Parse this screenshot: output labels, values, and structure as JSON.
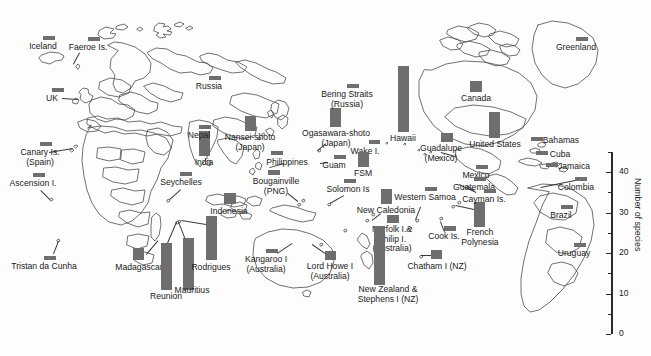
{
  "figure": {
    "type": "map-bar-chart",
    "title": "",
    "axis": {
      "label": "Number of species",
      "ticks_major": [
        0,
        10,
        20,
        30,
        40
      ],
      "ticks_minor": [
        5,
        15,
        25,
        35,
        45
      ],
      "range": [
        0,
        45
      ],
      "position": "right"
    },
    "bar_color": "#6e6e6e",
    "map_outline_color": "#4d4d4d"
  },
  "chart_data": {
    "type": "bar",
    "title": "",
    "xlabel": "",
    "ylabel": "Number of species",
    "ylim": [
      0,
      45
    ],
    "grid": false,
    "legend": "none",
    "categories": [
      "Iceland",
      "Faeroe Is.",
      "UK",
      "Canary Is. (Spain)",
      "Ascension I.",
      "Tristan da Cunha",
      "Madagascar",
      "Reunion",
      "Mauritius",
      "Rodrigues",
      "Seychelles",
      "Indonesia",
      "India",
      "Nepal",
      "Russia",
      "Nansei-shoto (Japan)",
      "Ogasawara-shoto (Japan)",
      "Bering Straits (Russia)",
      "Philippines",
      "Guam",
      "Bougainville (PNG)",
      "Solomon Is",
      "Wake I.",
      "FSM",
      "Hawaii",
      "Kangaroo I (Australia)",
      "Lord Howe I (Australia)",
      "New Caledonia",
      "Western Samoa",
      "Norfolk I. & Philip I. (Australia)",
      "New Zealand & Stephens I (NZ)",
      "Cook Is.",
      "Chatham I (NZ)",
      "French Polynesia",
      "Guadalupe (Mexico)",
      "Canada",
      "United States",
      "Greenland",
      "Mexico",
      "Guatemala",
      "Cayman Is.",
      "Bahamas",
      "Cuba",
      "Jamaica",
      "Colombia",
      "Brazil",
      "Uruguay"
    ],
    "values": [
      2,
      2,
      2,
      2,
      2,
      2,
      7,
      22,
      24,
      20,
      2,
      6,
      13,
      2,
      2,
      8,
      11,
      2,
      2,
      2,
      3,
      2,
      2,
      7,
      43,
      2,
      5,
      8,
      2,
      4,
      27,
      3,
      5,
      13,
      4,
      6,
      14,
      2,
      2,
      2,
      2,
      2,
      2,
      2,
      2,
      2,
      2
    ],
    "units": "species"
  },
  "locations": [
    {
      "name": "Iceland",
      "label": "Iceland",
      "bar_x": 43,
      "bar_y": 36,
      "bar_w": 12,
      "bar_h": 4,
      "label_x": 43,
      "label_y": 42,
      "align": "c",
      "leader": null
    },
    {
      "name": "Faeroe Is.",
      "label": "Faeroe Is.",
      "bar_x": 88,
      "bar_y": 37,
      "bar_w": 12,
      "bar_h": 4,
      "label_x": 88,
      "label_y": 43,
      "align": "c",
      "leader": {
        "x1": 80,
        "y1": 53,
        "x2": 74,
        "y2": 64
      }
    },
    {
      "name": "UK",
      "label": "UK",
      "bar_x": 52,
      "bar_y": 88,
      "bar_w": 12,
      "bar_h": 4,
      "label_x": 52,
      "label_y": 94,
      "align": "c",
      "leader": {
        "x1": 62,
        "y1": 98,
        "x2": 78,
        "y2": 99
      }
    },
    {
      "name": "Canary Is. (Spain)",
      "label": "Canary Is.\n(Spain)",
      "bar_x": 40,
      "bar_y": 142,
      "bar_w": 12,
      "bar_h": 4,
      "label_x": 40,
      "label_y": 148,
      "align": "c",
      "leader": {
        "x1": 49,
        "y1": 152,
        "x2": 73,
        "y2": 148
      }
    },
    {
      "name": "Ascension I.",
      "label": "Ascension I.",
      "bar_x": 33,
      "bar_y": 173,
      "bar_w": 12,
      "bar_h": 4,
      "label_x": 33,
      "label_y": 179,
      "align": "c",
      "leader": {
        "x1": 41,
        "y1": 190,
        "x2": 50,
        "y2": 199
      }
    },
    {
      "name": "Tristan da Cunha",
      "label": "Tristan da Cunha",
      "bar_x": 44,
      "bar_y": 256,
      "bar_w": 12,
      "bar_h": 4,
      "label_x": 44,
      "label_y": 262,
      "align": "c",
      "leader": {
        "x1": 53,
        "y1": 254,
        "x2": 58,
        "y2": 241
      }
    },
    {
      "name": "Madagascar",
      "label": "Madagascar",
      "bar_x": 133,
      "bar_y": 248,
      "bar_w": 11,
      "bar_h": 12,
      "label_x": 139,
      "label_y": 263,
      "align": "c",
      "leader": {
        "x1": 146,
        "y1": 254,
        "x2": 158,
        "y2": 240
      }
    },
    {
      "name": "Reunion",
      "label": "Reunion",
      "bar_x": 161,
      "bar_y": 243,
      "bar_w": 11,
      "bar_h": 47,
      "label_x": 166,
      "label_y": 292,
      "align": "c",
      "leader": {
        "x1": 167,
        "y1": 243,
        "x2": 176,
        "y2": 222
      }
    },
    {
      "name": "Mauritius",
      "label": "Mauritius",
      "bar_x": 183,
      "bar_y": 238,
      "bar_w": 11,
      "bar_h": 52,
      "label_x": 192,
      "label_y": 286,
      "align": "c",
      "leader": {
        "x1": 185,
        "y1": 240,
        "x2": 178,
        "y2": 222
      }
    },
    {
      "name": "Rodrigues",
      "label": "Rodrigues",
      "bar_x": 206,
      "bar_y": 216,
      "bar_w": 11,
      "bar_h": 44,
      "label_x": 211,
      "label_y": 263,
      "align": "c",
      "leader": {
        "x1": 206,
        "y1": 225,
        "x2": 181,
        "y2": 221
      }
    },
    {
      "name": "Seychelles",
      "label": "Seychelles",
      "bar_x": 180,
      "bar_y": 172,
      "bar_w": 12,
      "bar_h": 4,
      "label_x": 181,
      "label_y": 178,
      "align": "c",
      "leader": {
        "x1": 181,
        "y1": 190,
        "x2": 170,
        "y2": 200
      }
    },
    {
      "name": "Indonesia",
      "label": "Indonesia",
      "bar_x": 224,
      "bar_y": 193,
      "bar_w": 12,
      "bar_h": 11,
      "label_x": 229,
      "label_y": 207,
      "align": "c",
      "leader": null
    },
    {
      "name": "India",
      "label": "India",
      "bar_x": 199,
      "bar_y": 131,
      "bar_w": 11,
      "bar_h": 25,
      "label_x": 204,
      "label_y": 158,
      "align": "c",
      "leader": null
    },
    {
      "name": "Nepal",
      "label": "Nepal",
      "bar_x": 199,
      "bar_y": 125,
      "bar_w": 12,
      "bar_h": 4,
      "label_x": 199,
      "label_y": 131,
      "align": "c",
      "leader": null
    },
    {
      "name": "Russia",
      "label": "Russia",
      "bar_x": 209,
      "bar_y": 76,
      "bar_w": 12,
      "bar_h": 4,
      "label_x": 209,
      "label_y": 82,
      "align": "c",
      "leader": null
    },
    {
      "name": "Nansei-shoto (Japan)",
      "label": "Nansei-shoto\n(Japan)",
      "bar_x": 245,
      "bar_y": 116,
      "bar_w": 11,
      "bar_h": 15,
      "label_x": 250,
      "label_y": 133,
      "align": "c",
      "leader": null
    },
    {
      "name": "Ogasawara-shoto (Japan)",
      "label": "Ogasawara-shoto\n(Japan)",
      "bar_x": 330,
      "bar_y": 108,
      "bar_w": 11,
      "bar_h": 19,
      "label_x": 336,
      "label_y": 129,
      "align": "c",
      "leader": {
        "x1": 326,
        "y1": 144,
        "x2": 318,
        "y2": 151
      }
    },
    {
      "name": "Bering Straits (Russia)",
      "label": "Bering Straits\n(Russia)",
      "bar_x": 347,
      "bar_y": 84,
      "bar_w": 12,
      "bar_h": 4,
      "label_x": 347,
      "label_y": 90,
      "align": "c",
      "leader": null
    },
    {
      "name": "Philippines",
      "label": "Philippines",
      "bar_x": 271,
      "bar_y": 151,
      "bar_w": 12,
      "bar_h": 4,
      "label_x": 287,
      "label_y": 158,
      "align": "c",
      "leader": {
        "x1": 284,
        "y1": 164,
        "x2": 270,
        "y2": 168
      }
    },
    {
      "name": "Guam",
      "label": "Guam",
      "bar_x": 334,
      "bar_y": 155,
      "bar_w": 12,
      "bar_h": 4,
      "label_x": 334,
      "label_y": 161,
      "align": "c",
      "leader": {
        "x1": 328,
        "y1": 163,
        "x2": 320,
        "y2": 164
      }
    },
    {
      "name": "Bougainville (PNG)",
      "label": "Bougainville\n(PNG)",
      "bar_x": 268,
      "bar_y": 170,
      "bar_w": 12,
      "bar_h": 5,
      "label_x": 276,
      "label_y": 177,
      "align": "c",
      "leader": {
        "x1": 288,
        "y1": 193,
        "x2": 298,
        "y2": 201
      }
    },
    {
      "name": "Solomon Is",
      "label": "Solomon Is",
      "bar_x": 344,
      "bar_y": 179,
      "bar_w": 12,
      "bar_h": 4,
      "label_x": 348,
      "label_y": 185,
      "align": "c",
      "leader": {
        "x1": 344,
        "y1": 196,
        "x2": 330,
        "y2": 204
      }
    },
    {
      "name": "Wake I.",
      "label": "Wake I.",
      "bar_x": 369,
      "bar_y": 140,
      "bar_w": 11,
      "bar_h": 4,
      "label_x": 365,
      "label_y": 147,
      "align": "c",
      "leader": null
    },
    {
      "name": "FSM",
      "label": "FSM",
      "bar_x": 358,
      "bar_y": 152,
      "bar_w": 11,
      "bar_h": 15,
      "label_x": 363,
      "label_y": 169,
      "align": "c",
      "leader": null
    },
    {
      "name": "Hawaii",
      "label": "Hawaii",
      "bar_x": 398,
      "bar_y": 66,
      "bar_w": 11,
      "bar_h": 66,
      "label_x": 403,
      "label_y": 134,
      "align": "c",
      "leader": null
    },
    {
      "name": "Kangaroo I (Australia)",
      "label": "Kangaroo I\n(Australia)",
      "bar_x": 266,
      "bar_y": 249,
      "bar_w": 12,
      "bar_h": 4,
      "label_x": 266,
      "label_y": 255,
      "align": "c",
      "leader": {
        "x1": 277,
        "y1": 253,
        "x2": 292,
        "y2": 243
      }
    },
    {
      "name": "Lord Howe I (Australia)",
      "label": "Lord Howe I\n(Australia)",
      "bar_x": 325,
      "bar_y": 251,
      "bar_w": 11,
      "bar_h": 9,
      "label_x": 330,
      "label_y": 262,
      "align": "c",
      "leader": {
        "x1": 325,
        "y1": 254,
        "x2": 312,
        "y2": 245
      }
    },
    {
      "name": "New Caledonia",
      "label": "New Caledonia",
      "bar_x": 381,
      "bar_y": 189,
      "bar_w": 11,
      "bar_h": 15,
      "label_x": 386,
      "label_y": 206,
      "align": "c",
      "leader": {
        "x1": 381,
        "y1": 214,
        "x2": 372,
        "y2": 221
      }
    },
    {
      "name": "Western Samoa",
      "label": "Western Samoa",
      "bar_x": 425,
      "bar_y": 187,
      "bar_w": 12,
      "bar_h": 4,
      "label_x": 425,
      "label_y": 193,
      "align": "c",
      "leader": {
        "x1": 421,
        "y1": 207,
        "x2": 416,
        "y2": 220
      }
    },
    {
      "name": "Norfolk I. & Philip I. (Australia)",
      "label": "Norfolk I.&\nPhilip I.\n(Australia)",
      "bar_x": 387,
      "bar_y": 215,
      "bar_w": 12,
      "bar_h": 8,
      "label_x": 392,
      "label_y": 225,
      "align": "c",
      "leader": null
    },
    {
      "name": "New Zealand & Stephens I (NZ)",
      "label": "New Zealand &\nStephens I (NZ)",
      "bar_x": 374,
      "bar_y": 226,
      "bar_w": 11,
      "bar_h": 59,
      "label_x": 388,
      "label_y": 285,
      "align": "c",
      "leader": null
    },
    {
      "name": "Cook Is.",
      "label": "Cook Is.",
      "bar_x": 444,
      "bar_y": 226,
      "bar_w": 12,
      "bar_h": 5,
      "label_x": 444,
      "label_y": 232,
      "align": "c",
      "leader": {
        "x1": 444,
        "y1": 232,
        "x2": 440,
        "y2": 222
      }
    },
    {
      "name": "Chatham I (NZ)",
      "label": "Chatham I (NZ)",
      "bar_x": 431,
      "bar_y": 250,
      "bar_w": 11,
      "bar_h": 9,
      "label_x": 437,
      "label_y": 262,
      "align": "c",
      "leader": {
        "x1": 431,
        "y1": 256,
        "x2": 421,
        "y2": 256
      }
    },
    {
      "name": "French Polynesia",
      "label": "French\nPolynesia",
      "bar_x": 474,
      "bar_y": 202,
      "bar_w": 11,
      "bar_h": 25,
      "label_x": 480,
      "label_y": 228,
      "align": "c",
      "leader": {
        "x1": 474,
        "y1": 210,
        "x2": 455,
        "y2": 206
      }
    },
    {
      "name": "Guadalupe (Mexico)",
      "label": "Guadalupe\n(Mexico)",
      "bar_x": 441,
      "bar_y": 133,
      "bar_w": 12,
      "bar_h": 9,
      "label_x": 441,
      "label_y": 144,
      "align": "c",
      "leader": {
        "x1": 441,
        "y1": 152,
        "x2": 455,
        "y2": 156
      }
    },
    {
      "name": "Canada",
      "label": "Canada",
      "bar_x": 470,
      "bar_y": 81,
      "bar_w": 12,
      "bar_h": 11,
      "label_x": 476,
      "label_y": 94,
      "align": "c",
      "leader": null
    },
    {
      "name": "United States",
      "label": "United States",
      "bar_x": 489,
      "bar_y": 112,
      "bar_w": 11,
      "bar_h": 26,
      "label_x": 495,
      "label_y": 140,
      "align": "c",
      "leader": null
    },
    {
      "name": "Greenland",
      "label": "Greenland",
      "bar_x": 576,
      "bar_y": 37,
      "bar_w": 12,
      "bar_h": 4,
      "label_x": 576,
      "label_y": 43,
      "align": "c",
      "leader": null
    },
    {
      "name": "Mexico",
      "label": "Mexico",
      "bar_x": 476,
      "bar_y": 165,
      "bar_w": 12,
      "bar_h": 4,
      "label_x": 476,
      "label_y": 171,
      "align": "c",
      "leader": null
    },
    {
      "name": "Guatemala",
      "label": "Guatemala",
      "bar_x": 474,
      "bar_y": 177,
      "bar_w": 12,
      "bar_h": 4,
      "label_x": 474,
      "label_y": 183,
      "align": "c",
      "leader": {
        "x1": 474,
        "y1": 191,
        "x2": 466,
        "y2": 186
      }
    },
    {
      "name": "Cayman Is.",
      "label": "Cayman Is.",
      "bar_x": 484,
      "bar_y": 189,
      "bar_w": 12,
      "bar_h": 4,
      "label_x": 484,
      "label_y": 195,
      "align": "c",
      "leader": {
        "x1": 476,
        "y1": 193,
        "x2": 459,
        "y2": 185
      }
    },
    {
      "name": "Bahamas",
      "label": "Bahamas",
      "bar_x": 531,
      "bar_y": 137,
      "bar_w": 12,
      "bar_h": 4,
      "label_x": 561,
      "label_y": 136,
      "align": "c",
      "leader": null
    },
    {
      "name": "Cuba",
      "label": "Cuba",
      "bar_x": 536,
      "bar_y": 151,
      "bar_w": 12,
      "bar_h": 4,
      "label_x": 560,
      "label_y": 150,
      "align": "c",
      "leader": null
    },
    {
      "name": "Jamaica",
      "label": "Jamaica",
      "bar_x": 546,
      "bar_y": 163,
      "bar_w": 12,
      "bar_h": 4,
      "label_x": 574,
      "label_y": 162,
      "align": "c",
      "leader": null
    },
    {
      "name": "Colombia",
      "label": "Colombia",
      "bar_x": 575,
      "bar_y": 177,
      "bar_w": 12,
      "bar_h": 4,
      "label_x": 576,
      "label_y": 183,
      "align": "c",
      "leader": {
        "x1": 575,
        "y1": 181,
        "x2": 541,
        "y2": 188
      }
    },
    {
      "name": "Brazil",
      "label": "Brazil",
      "bar_x": 561,
      "bar_y": 205,
      "bar_w": 12,
      "bar_h": 4,
      "label_x": 561,
      "label_y": 211,
      "align": "c",
      "leader": null
    },
    {
      "name": "Uruguay",
      "label": "Uruguay",
      "bar_x": 574,
      "bar_y": 243,
      "bar_w": 12,
      "bar_h": 4,
      "label_x": 574,
      "label_y": 249,
      "align": "c",
      "leader": null
    }
  ]
}
